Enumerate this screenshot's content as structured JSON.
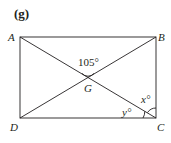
{
  "part_label": "(g)",
  "figure": {
    "type": "rectangle-with-diagonals",
    "vertices": {
      "A": {
        "label": "A",
        "x": 20,
        "y": 37
      },
      "B": {
        "label": "B",
        "x": 156,
        "y": 37
      },
      "C": {
        "label": "C",
        "x": 156,
        "y": 118
      },
      "D": {
        "label": "D",
        "x": 20,
        "y": 118
      }
    },
    "intersection": {
      "label": "G",
      "x": 88,
      "y": 77.5
    },
    "angles": {
      "AGB": "105°",
      "x": "x°",
      "y": "y°"
    }
  },
  "colors": {
    "ink": "#231f20",
    "background": "#ffffff"
  }
}
